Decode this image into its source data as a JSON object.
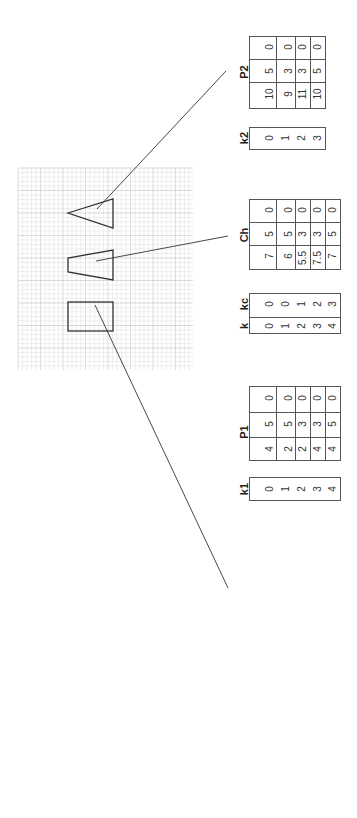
{
  "diagram": {
    "orientation": "rotated-90-ccw",
    "shapes": [
      {
        "name": "P1",
        "type": "square",
        "label_ref": "P1"
      },
      {
        "name": "Ch",
        "type": "trapezoid",
        "label_ref": "Ch"
      },
      {
        "name": "P2",
        "type": "triangle",
        "label_ref": "P2"
      }
    ],
    "tables": {
      "k1": {
        "header": "k1",
        "values": [
          "0",
          "1",
          "2",
          "3",
          "4"
        ]
      },
      "P1": {
        "header": "P1",
        "rows": [
          [
            "4",
            "5",
            "0"
          ],
          [
            "2",
            "5",
            "0"
          ],
          [
            "2",
            "3",
            "0"
          ],
          [
            "4",
            "3",
            "0"
          ],
          [
            "4",
            "5",
            "0"
          ]
        ]
      },
      "k_kc": {
        "headers": [
          "k",
          "kc"
        ],
        "rows": [
          [
            "0",
            "0"
          ],
          [
            "1",
            "0"
          ],
          [
            "2",
            "1"
          ],
          [
            "3",
            "2"
          ],
          [
            "4",
            "3"
          ]
        ]
      },
      "Ch": {
        "header": "Ch",
        "rows": [
          [
            "7",
            "5",
            "0"
          ],
          [
            "6",
            "5",
            "0"
          ],
          [
            "5.5",
            "3",
            "0"
          ],
          [
            "7.5",
            "3",
            "0"
          ],
          [
            "7",
            "5",
            "0"
          ]
        ]
      },
      "k2": {
        "header": "k2",
        "values": [
          "0",
          "1",
          "2",
          "3"
        ]
      },
      "P2": {
        "header": "P2",
        "rows": [
          [
            "10",
            "5",
            "0"
          ],
          [
            "9",
            "3",
            "0"
          ],
          [
            "11",
            "3",
            "0"
          ],
          [
            "10",
            "5",
            "0"
          ]
        ]
      }
    },
    "colors": {
      "grid_minor": "#e2e2e2",
      "grid_major": "#c4c4c4",
      "stroke": "#333333",
      "table_border": "#555555"
    }
  }
}
